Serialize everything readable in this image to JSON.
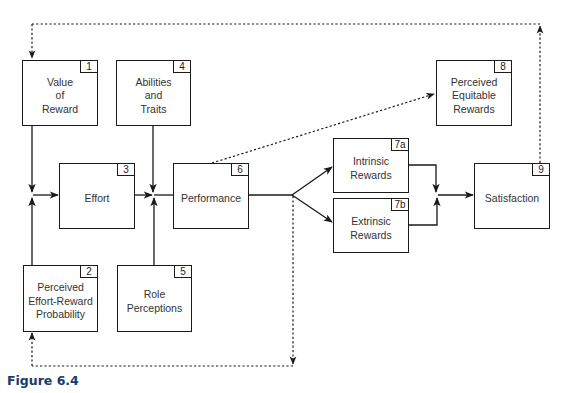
{
  "figure": {
    "caption": "Figure 6.4",
    "colors": {
      "line": "#1a1a1a",
      "text": "#333333",
      "caption": "#1a3a6a"
    }
  },
  "boxes": {
    "value_of_reward": {
      "num": "1",
      "label": "Value\nof\nReward"
    },
    "perceived_effort_reward_probability": {
      "num": "2",
      "label": "Perceived\nEffort-Reward\nProbability"
    },
    "effort": {
      "num": "3",
      "label": "Effort"
    },
    "abilities_and_traits": {
      "num": "4",
      "label": "Abilities\nand\nTraits"
    },
    "role_perceptions": {
      "num": "5",
      "label": "Role\nPerceptions"
    },
    "performance": {
      "num": "6",
      "label": "Performance"
    },
    "intrinsic_rewards": {
      "num": "7a",
      "label": "Intrinsic\nRewards"
    },
    "extrinsic_rewards": {
      "num": "7b",
      "label": "Extrinsic\nRewards"
    },
    "perceived_equitable_rewards": {
      "num": "8",
      "label": "Perceived\nEquitable\nRewards"
    },
    "satisfaction": {
      "num": "9",
      "label": "Satisfaction"
    }
  },
  "connections": [
    {
      "from": "1",
      "to": "3",
      "style": "solid"
    },
    {
      "from": "2",
      "to": "3",
      "style": "solid"
    },
    {
      "from": "3",
      "to": "6",
      "style": "solid"
    },
    {
      "from": "4",
      "to": "6",
      "style": "solid"
    },
    {
      "from": "5",
      "to": "6",
      "style": "solid"
    },
    {
      "from": "6",
      "to": "7a",
      "style": "solid"
    },
    {
      "from": "6",
      "to": "7b",
      "style": "solid"
    },
    {
      "from": "6",
      "to": "8",
      "style": "dotted"
    },
    {
      "from": "7a",
      "to": "9",
      "style": "solid"
    },
    {
      "from": "7b",
      "to": "9",
      "style": "solid"
    },
    {
      "from": "9",
      "to": "1",
      "style": "dotted"
    },
    {
      "from": "6",
      "to": "2",
      "style": "dotted"
    }
  ]
}
